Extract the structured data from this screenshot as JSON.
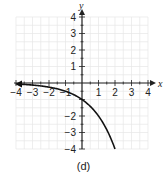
{
  "chart_data": {
    "type": "line",
    "title": "",
    "caption": "(d)",
    "xlabel": "x",
    "ylabel": "y",
    "xlim": [
      -4,
      4
    ],
    "ylim": [
      -4,
      4
    ],
    "grid": true,
    "minor_grid_step": 0.5,
    "x_ticks": [
      -4,
      -3,
      -2,
      -1,
      1,
      2,
      3,
      4
    ],
    "x_tick_labels": [
      "−4",
      "−3",
      "−2",
      "−1",
      "1",
      "2",
      "3",
      "4"
    ],
    "y_ticks": [
      4,
      3,
      2,
      1,
      -2,
      -3,
      -4
    ],
    "y_tick_labels": [
      "4",
      "3",
      "2",
      "1",
      "−2",
      "−3",
      "−4"
    ],
    "series": [
      {
        "name": "y = -2^x",
        "x": [
          -4,
          -3,
          -2,
          -1,
          0,
          1,
          1.5,
          2
        ],
        "y": [
          -0.0625,
          -0.125,
          -0.25,
          -0.5,
          -1,
          -2,
          -2.83,
          -4
        ],
        "arrow_left": true,
        "color": "#111111"
      }
    ]
  },
  "colors": {
    "grid": "#e6e6e6",
    "axis": "#222222",
    "curve": "#111111"
  }
}
